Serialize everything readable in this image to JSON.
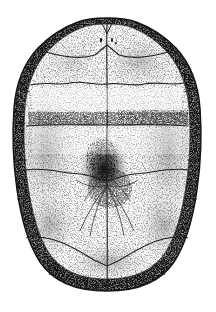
{
  "image": {
    "subject": "turtle-plastron",
    "view": "ventral",
    "technique": "stippled line engraving",
    "width": 216,
    "height": 312,
    "background_color": "#ffffff",
    "ink_color": "#1a1a1a",
    "shade_light": "#cfcfcf",
    "shade_mid": "#9a9a9a",
    "shade_dark": "#4a4a4a",
    "rim_color": "#3a3a3a"
  },
  "outline": {
    "name": "plastron-outline",
    "top_y": 18,
    "bottom_y": 291,
    "left_x": 13,
    "right_x": 201,
    "center_x": 107,
    "shape": "broad oval, narrowed and notched anteriorly, rounded posteriorly"
  },
  "midline": {
    "name": "median-seam",
    "x": 107,
    "from_y": 22,
    "to_y": 290
  },
  "seams": [
    {
      "name": "gular-humeral-seam",
      "y": 60,
      "style": "shallow-V",
      "label": "gular / humeral"
    },
    {
      "name": "humeral-pectoral-seam",
      "y": 84,
      "style": "wavy",
      "label": "humeral / pectoral"
    },
    {
      "name": "pectoral-abdominal-seam",
      "y": 125,
      "style": "straight",
      "label": "pectoral / abdominal"
    },
    {
      "name": "abdominal-femoral-seam",
      "y": 173,
      "style": "wavy",
      "label": "abdominal / femoral"
    },
    {
      "name": "femoral-anal-seam",
      "y": 240,
      "style": "chevron",
      "label": "femoral / anal"
    }
  ],
  "scutes": [
    {
      "name": "gular-scute-left",
      "label": "gular",
      "side": "left"
    },
    {
      "name": "gular-scute-right",
      "label": "gular",
      "side": "right"
    },
    {
      "name": "humeral-scute-left",
      "label": "humeral",
      "side": "left"
    },
    {
      "name": "humeral-scute-right",
      "label": "humeral",
      "side": "right"
    },
    {
      "name": "pectoral-scute-left",
      "label": "pectoral",
      "side": "left"
    },
    {
      "name": "pectoral-scute-right",
      "label": "pectoral",
      "side": "right"
    },
    {
      "name": "abdominal-scute-left",
      "label": "abdominal",
      "side": "left"
    },
    {
      "name": "abdominal-scute-right",
      "label": "abdominal",
      "side": "right"
    },
    {
      "name": "femoral-scute-left",
      "label": "femoral",
      "side": "left"
    },
    {
      "name": "femoral-scute-right",
      "label": "femoral",
      "side": "right"
    },
    {
      "name": "anal-scute-left",
      "label": "anal",
      "side": "left"
    },
    {
      "name": "anal-scute-right",
      "label": "anal",
      "side": "right"
    }
  ],
  "marginal_band": {
    "name": "marginal-scute-band",
    "description": "dark stippled rim of marginal scutes running around the whole margin",
    "segment_count": 11,
    "darkest_regions": [
      "upper-left shoulder",
      "upper-right shoulder",
      "posterior edge"
    ]
  },
  "central_blotch": {
    "name": "central-dark-blotch",
    "center_x": 104,
    "center_y": 168,
    "width": 44,
    "height": 54,
    "description": "dense dark stippled patch over the abdominal midline"
  },
  "radiating_lines": {
    "name": "radiating-seam-lines",
    "origin_x": 107,
    "origin_y": 186,
    "count": 6,
    "description": "fine fracture lines fanning downward and outward from the abdominal centre"
  },
  "gular_notch": {
    "name": "anterior-gular-notch",
    "x": 107,
    "y": 22,
    "description": "shallow median notch between the paired gular scutes"
  },
  "pore_marks": {
    "name": "gular-pore-marks",
    "count": 3,
    "description": "small dark specks on the gular scutes near the midline"
  }
}
